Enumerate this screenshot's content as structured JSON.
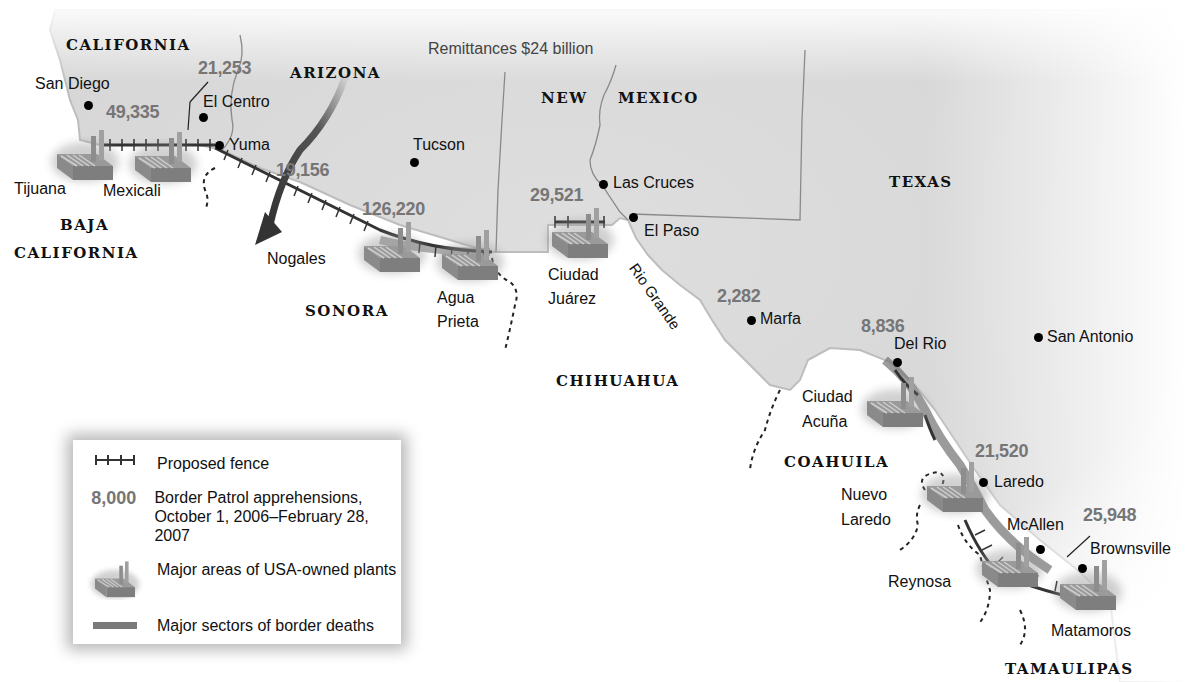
{
  "map": {
    "title": "US-Mexico border: fence, apprehensions, plants and border deaths",
    "remittances_label": "Remittances $24 billion",
    "states_us": [
      "CALIFORNIA",
      "ARIZONA",
      "NEW",
      "MEXICO",
      "TEXAS"
    ],
    "states_mx": [
      "BAJA",
      "CALIFORNIA",
      "SONORA",
      "CHIHUAHUA",
      "COAHUILA",
      "TAMAULIPAS"
    ],
    "river_label": "Rio Grande",
    "us_cities": [
      "San Diego",
      "El Centro",
      "Yuma",
      "Tucson",
      "Las Cruces",
      "El Paso",
      "Marfa",
      "Del Rio",
      "San Antonio",
      "Laredo",
      "McAllen",
      "Brownsville"
    ],
    "mx_cities": [
      "Tijuana",
      "Mexicali",
      "Nogales",
      "Agua",
      "Prieta",
      "Ciudad",
      "Juárez",
      "Ciudad",
      "Acuña",
      "Nuevo",
      "Laredo",
      "Reynosa",
      "Matamoros"
    ],
    "apprehensions": [
      {
        "sector": "San Diego",
        "value": "49,335"
      },
      {
        "sector": "El Centro",
        "value": "21,253"
      },
      {
        "sector": "Yuma",
        "value": "19,156"
      },
      {
        "sector": "Tucson",
        "value": "126,220"
      },
      {
        "sector": "El Paso",
        "value": "29,521"
      },
      {
        "sector": "Marfa",
        "value": "2,282"
      },
      {
        "sector": "Del Rio",
        "value": "8,836"
      },
      {
        "sector": "Laredo",
        "value": "21,520"
      },
      {
        "sector": "Rio Grande Valley",
        "value": "25,948"
      }
    ],
    "colors": {
      "land_us": "#d9d9d9",
      "land_mx": "#ffffff",
      "numbers": "#767676",
      "deaths_sector": "#7a7a7a",
      "arrow": "#3a3a3a"
    }
  },
  "legend": {
    "fence_label": "Proposed fence",
    "sample_number": "8,000",
    "apprehensions_line1": "Border Patrol apprehensions,",
    "apprehensions_line2": "October 1, 2006–February 28, 2007",
    "plants_label": "Major areas of USA-owned plants",
    "deaths_label": "Major sectors of border deaths",
    "icons": [
      "fence-icon",
      "number-sample",
      "factory-icon",
      "death-sector-bar-icon"
    ]
  }
}
